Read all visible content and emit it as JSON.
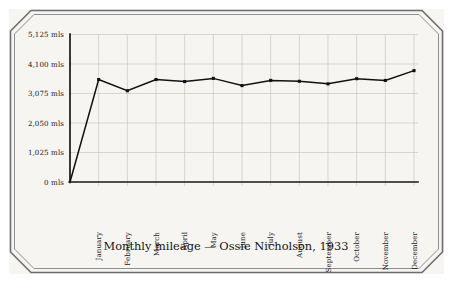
{
  "chart_data": {
    "type": "line",
    "title": "Monthly mileage — Ossie Nicholson, 1933",
    "xlabel": "",
    "ylabel": "",
    "ylim": [
      0,
      5125
    ],
    "grid": true,
    "legend": "none",
    "y_tick_labels": [
      "0 mls",
      "1,025 mls",
      "2,050 mls",
      "3,075 mls",
      "4,100 mls",
      "5,125 mls"
    ],
    "y_tick_values": [
      0,
      1025,
      2050,
      3075,
      4100,
      5125
    ],
    "unit_suffix": "mls",
    "categories": [
      "January",
      "February",
      "March",
      "April",
      "May",
      "June",
      "July",
      "August",
      "September",
      "October",
      "November",
      "December"
    ],
    "values": [
      3560,
      3170,
      3560,
      3490,
      3600,
      3350,
      3530,
      3500,
      3410,
      3590,
      3530,
      3870
    ],
    "series": [
      {
        "name": "Monthly mileage",
        "values": [
          3560,
          3170,
          3560,
          3490,
          3600,
          3350,
          3530,
          3500,
          3410,
          3590,
          3530,
          3870
        ]
      }
    ],
    "marker_style": "square",
    "line_color": "#111111",
    "grid_color": "#c9c7c2",
    "axis_color": "#171717",
    "background_color": "#f6f5f2",
    "frame_color": "#5a5a5a",
    "origin_included": true
  },
  "frame": {
    "label": "beveled-card-frame"
  }
}
